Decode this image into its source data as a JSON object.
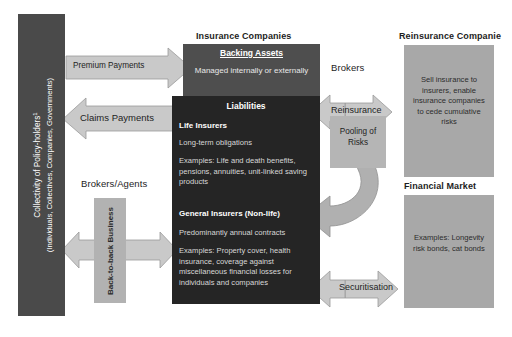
{
  "figure": {
    "colors": {
      "policyholder_box": "#4a4a4a",
      "backing_assets_box": "#4e4e4e",
      "liabilities_box": "#252525",
      "right_boxes": "#a8a8a8",
      "arrow_fill": "#c6c6c6",
      "arrow_stroke": "#8a8a8a",
      "background": "#ffffff"
    }
  },
  "policyholders": {
    "line1": "Collectivity of Policy-holders",
    "footnote_marker": "1",
    "line2": "(Individuals, Collectives, Companies, Governments)"
  },
  "brokers_agents": {
    "heading": "Brokers/Agents",
    "box_label": "Back-to-back Business"
  },
  "insurance": {
    "heading": "Insurance Companies",
    "backing_assets": {
      "title": "Backing Assets",
      "body": "Managed internally or externally"
    },
    "liabilities": {
      "title": "Liabilities",
      "life": {
        "title": "Life Insurers",
        "line1": "Long-term obligations",
        "examples": "Examples: Life and death benefits, pensions, annuities, unit-linked saving products"
      },
      "general": {
        "title": "General Insurers (Non-life)",
        "line1": "Predominantly annual contracts",
        "examples": "Examples: Property cover, health insurance, coverage against miscellaneous financial losses for individuals and companies"
      }
    }
  },
  "reinsurance": {
    "heading": "Reinsurance Companie",
    "body": "Sell insurance to insurers, enable insurance companies to cede cumulative risks"
  },
  "financial_market": {
    "heading": "Financial Market",
    "body": "Examples: Longevity risk bonds, cat bonds"
  },
  "brokers": {
    "heading": "Brokers"
  },
  "pooling": {
    "label": "Pooling of Risks"
  },
  "arrows": {
    "premium_payments": "Premium Payments",
    "claims_payments": "Claims Payments",
    "reinsurance": "Reinsurance",
    "securitisation": "Securitisation"
  }
}
